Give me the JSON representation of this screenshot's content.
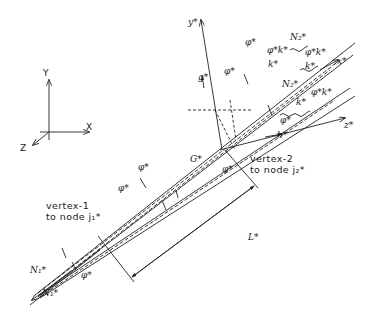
{
  "global_axes": {
    "y": "Y",
    "x": "X",
    "z": "Z"
  },
  "local_axes": {
    "y": "y*",
    "x": "x*",
    "z": "z*"
  },
  "vertex1": {
    "line1": "vertex-1",
    "line2": "to node j₁*"
  },
  "vertex2": {
    "line1": "vertex-2",
    "line2": "to node j₂*"
  },
  "symbols": {
    "length": "L*",
    "g": "g*",
    "h": "h*",
    "phi_top": "φ*",
    "phi_a": "φ*",
    "phi_b": "φ*",
    "phi_c": "φ*",
    "phi_d": "φ*",
    "phi_e": "φ*",
    "phi_f": "φ*",
    "N_bot1": "N₁*",
    "N_bot2": "N₁*",
    "N_top": "N₂*",
    "N_mid": "N₂*",
    "k_top1": "φ*k*",
    "k_top2": "k*",
    "k_top3": "φ*k*",
    "k_top4": "k*",
    "k_mid1": "φ*k*",
    "k_mid2": "k*",
    "G": "G*"
  }
}
